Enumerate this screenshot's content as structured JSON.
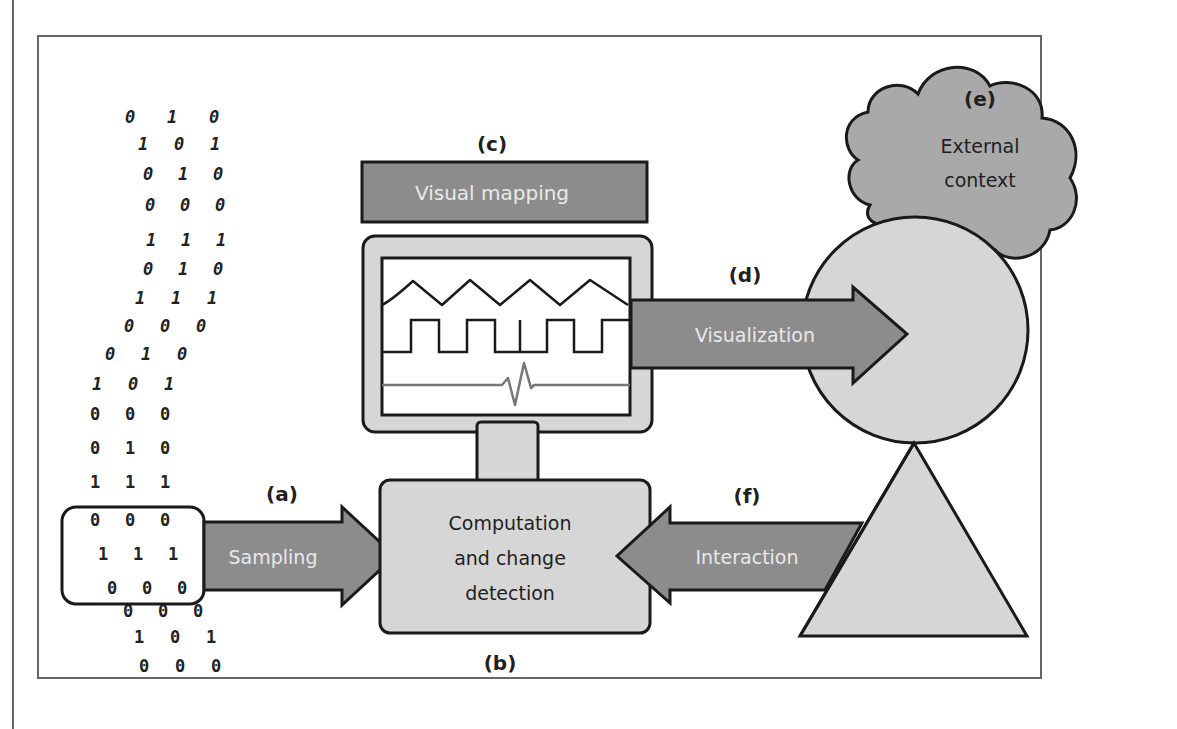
{
  "diagram": {
    "colors": {
      "background": "#ffffff",
      "frame": "#666666",
      "stroke": "#1a1a1a",
      "dark_fill": "#8c8c8c",
      "light_fill": "#d6d6d6",
      "cloud_fill": "#a9a9a9",
      "screen_fill": "#ffffff",
      "ecg_line": "#777777",
      "arrow_text": "#e9e9e9",
      "label_text": "#1f1f1f"
    },
    "labels": {
      "a": "(a)",
      "b": "(b)",
      "c": "(c)",
      "d": "(d)",
      "e": "(e)",
      "f": "(f)"
    },
    "nodes": {
      "visual_mapping": "Visual mapping",
      "computation_line1": "Computation",
      "computation_line2": "and change",
      "computation_line3": "detection",
      "external_line1": "External",
      "external_line2": "context"
    },
    "arrows": {
      "sampling": "Sampling",
      "visualization": "Visualization",
      "interaction": "Interaction"
    },
    "bit_stream": [
      [
        "0",
        "1",
        "0"
      ],
      [
        "1",
        "0",
        "1"
      ],
      [
        "0",
        "1",
        "0"
      ],
      [
        "0",
        "0",
        "0"
      ],
      [
        "1",
        "1",
        "1"
      ],
      [
        "0",
        "1",
        "0"
      ],
      [
        "1",
        "1",
        "1"
      ],
      [
        "0",
        "0",
        "0"
      ],
      [
        "0",
        "1",
        "0"
      ],
      [
        "1",
        "0",
        "1"
      ],
      [
        "0",
        "0",
        "0"
      ],
      [
        "0",
        "1",
        "0"
      ],
      [
        "1",
        "1",
        "1"
      ],
      [
        "0",
        "0",
        "0"
      ],
      [
        "1",
        "1",
        "1"
      ],
      [
        "0",
        "0",
        "0"
      ],
      [
        "0",
        "0",
        "0"
      ],
      [
        "1",
        "0",
        "1"
      ],
      [
        "0",
        "0",
        "0"
      ]
    ],
    "screen_signals": [
      "triangle-wave",
      "square-wave",
      "ecg-spike"
    ]
  }
}
